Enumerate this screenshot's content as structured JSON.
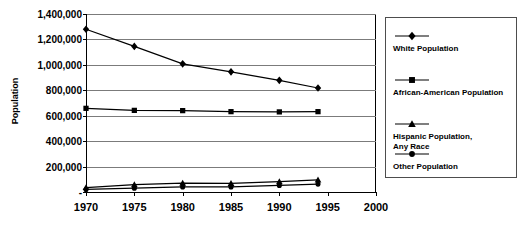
{
  "chart_data": {
    "type": "line",
    "title": "",
    "title_note": "title clipped at top edge of screenshot, not legible",
    "xlabel": "",
    "ylabel": "Population",
    "x": [
      1970,
      1975,
      1980,
      1985,
      1990,
      1994
    ],
    "xlim": [
      1970,
      2000
    ],
    "ylim": [
      0,
      1400000
    ],
    "xticks": [
      "1970",
      "1975",
      "1980",
      "1985",
      "1990",
      "1995",
      "2000"
    ],
    "xtick_values": [
      1970,
      1975,
      1980,
      1985,
      1990,
      1995,
      2000
    ],
    "yticks": [
      "-",
      "200,000",
      "400,000",
      "600,000",
      "800,000",
      "1,000,000",
      "1,200,000",
      "1,400,000"
    ],
    "ytick_values": [
      0,
      200000,
      400000,
      600000,
      800000,
      1000000,
      1200000,
      1400000
    ],
    "grid": true,
    "legend_position": "right",
    "series": [
      {
        "name": "White Population",
        "marker": "diamond",
        "values": [
          1280000,
          1145000,
          1008000,
          945000,
          878000,
          818000
        ]
      },
      {
        "name": "African-American Population",
        "marker": "square",
        "values": [
          658000,
          642000,
          640000,
          632000,
          630000,
          632000
        ]
      },
      {
        "name": "Hispanic Population, Any Race",
        "marker": "triangle",
        "values": [
          35000,
          58000,
          70000,
          68000,
          82000,
          95000
        ]
      },
      {
        "name": "Other Population",
        "marker": "circle",
        "values": [
          20000,
          30000,
          40000,
          40000,
          52000,
          62000
        ]
      }
    ]
  },
  "axis": {
    "y_title": "Population"
  },
  "legend": {
    "entries": [
      {
        "label": "White Population",
        "marker": "diamond"
      },
      {
        "label": "African-American Population",
        "marker": "square"
      },
      {
        "label": "Hispanic Population,\nAny Race",
        "marker": "triangle"
      },
      {
        "label": "Other Population",
        "marker": "circle"
      }
    ]
  },
  "colors": {
    "series": "#000000",
    "grid": "#7b7b7b",
    "axis": "#000000",
    "legend_border": "#4d4d4d",
    "background": "#ffffff"
  }
}
